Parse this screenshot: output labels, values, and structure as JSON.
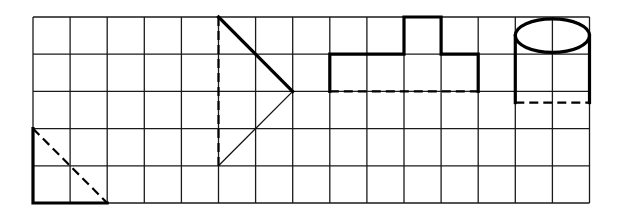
{
  "diagram": {
    "title": "",
    "grid": {
      "columns": 15,
      "rows": 5,
      "origin_x": 33,
      "origin_y": 17,
      "cell_width": 37.1,
      "cell_height": 37.2,
      "line_color": "#1a1a1a",
      "background": "#ffffff"
    },
    "shapes": [
      {
        "id": "shape-corner-triangle",
        "description": "Right-angle corner with dashed hypotenuse",
        "solid_paths": [
          [
            [
              0,
              3
            ],
            [
              0,
              5
            ],
            [
              2,
              5
            ]
          ]
        ],
        "dashed_paths": [
          [
            [
              0,
              3
            ],
            [
              2,
              5
            ]
          ]
        ],
        "thin_paths": []
      },
      {
        "id": "shape-arrow-triangle",
        "description": "Triangle with dashed vertical side, thick upper edge, thin lower edge",
        "solid_paths": [
          [
            [
              5,
              0
            ],
            [
              7,
              2
            ]
          ]
        ],
        "dashed_paths": [
          [
            [
              5,
              0
            ],
            [
              5,
              4
            ]
          ]
        ],
        "thin_paths": [
          [
            [
              7,
              2
            ],
            [
              5,
              4
            ]
          ]
        ]
      },
      {
        "id": "shape-stepped-block",
        "description": "Stepped outline with a raised notch and dashed base",
        "solid_paths": [
          [
            [
              8,
              2
            ],
            [
              8,
              1
            ],
            [
              10,
              1
            ],
            [
              10,
              0
            ],
            [
              11,
              0
            ],
            [
              11,
              1
            ],
            [
              12,
              1
            ],
            [
              12,
              2
            ]
          ]
        ],
        "dashed_paths": [
          [
            [
              8,
              2
            ],
            [
              12,
              2
            ]
          ]
        ],
        "thin_paths": []
      },
      {
        "id": "shape-cylinder",
        "description": "Cylinder: ellipse top, two thick sides, dashed base",
        "ellipse": {
          "cx": 14,
          "cy": 0.5,
          "rx": 1.0,
          "ry": 0.45
        },
        "solid_paths": [
          [
            [
              13,
              0.5
            ],
            [
              13,
              2.3
            ]
          ],
          [
            [
              15,
              0.5
            ],
            [
              15,
              2.3
            ]
          ]
        ],
        "dashed_paths": [
          [
            [
              13,
              2.3
            ],
            [
              15,
              2.3
            ]
          ]
        ],
        "thin_paths": []
      }
    ]
  }
}
